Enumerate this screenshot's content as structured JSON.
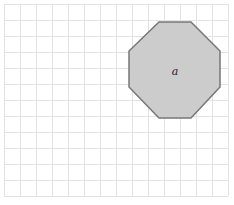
{
  "diagram": {
    "type": "grid-shape",
    "grid": {
      "origin_x": 4,
      "origin_y": 4,
      "cell_size": 16,
      "columns": 14,
      "rows": 12,
      "line_color": "#e3e3e3"
    },
    "shapes": [
      {
        "kind": "octagon",
        "label": "a",
        "fill": "#cccccc",
        "stroke": "#777777",
        "points": [
          [
            159,
            22
          ],
          [
            191,
            22
          ],
          [
            220,
            51
          ],
          [
            220,
            87
          ],
          [
            191,
            118
          ],
          [
            159,
            118
          ],
          [
            129,
            87
          ],
          [
            129,
            51
          ]
        ],
        "label_position": [
          175,
          71
        ]
      }
    ]
  }
}
